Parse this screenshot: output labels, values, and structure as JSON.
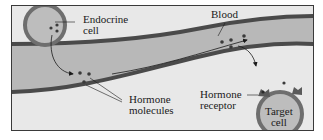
{
  "diagram": {
    "colors": {
      "background": "#e8e8e8",
      "vessel_wall": "#4a4a4a",
      "vessel_lumen": "#b8b8b8",
      "cell_membrane": "#6e6e6e",
      "cell_cytoplasm": "#bdbdbd",
      "molecule": "#3a3a3a",
      "text": "#1a1a1a"
    },
    "labels": {
      "endocrine_cell_line1": "Endocrine",
      "endocrine_cell_line2": "cell",
      "blood": "Blood",
      "hormone_molecules_line1": "Hormone",
      "hormone_molecules_line2": "molecules",
      "hormone_receptor_line1": "Hormone",
      "hormone_receptor_line2": "receptor",
      "target_cell_line1": "Target",
      "target_cell_line2": "cell"
    },
    "nodes": [
      {
        "id": "endocrine-cell",
        "label": "Endocrine cell"
      },
      {
        "id": "blood-vessel",
        "label": "Blood"
      },
      {
        "id": "hormone-molecules",
        "label": "Hormone molecules"
      },
      {
        "id": "hormone-receptor",
        "label": "Hormone receptor"
      },
      {
        "id": "target-cell",
        "label": "Target cell"
      }
    ],
    "edges": [
      {
        "from": "endocrine-cell",
        "to": "blood-vessel",
        "label": "hormone secreted"
      },
      {
        "from": "blood-vessel",
        "to": "blood-vessel",
        "label": "carried in bloodstream"
      },
      {
        "from": "blood-vessel",
        "to": "hormone-receptor",
        "label": "binds receptor"
      }
    ]
  }
}
